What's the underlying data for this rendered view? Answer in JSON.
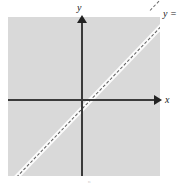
{
  "figure": {
    "name": "cartesian-plane-with-identity-line",
    "background_color": "#ffffff",
    "plane_fill_color": "#d9d9d9",
    "axis_color": "#3a3a3a",
    "line_color": "#5c5c5c",
    "line_highlight_color": "#fbfbfb"
  },
  "axes": {
    "y_label": "y",
    "x_label": "x",
    "y_arrow_direction": "up",
    "x_arrow_direction": "right",
    "origin_label": ""
  },
  "annotations": {
    "line_equation": "y =",
    "caption_mark": "n"
  },
  "chart_data": {
    "type": "line",
    "title": "",
    "xlabel": "x",
    "ylabel": "y",
    "xlim": [
      -5,
      5
    ],
    "ylim": [
      -5,
      5
    ],
    "grid": false,
    "legend": "none",
    "series": [
      {
        "name": "y =",
        "style": "dashed",
        "color": "#5c5c5c",
        "x": [
          -5,
          5
        ],
        "values": [
          -5,
          5
        ]
      }
    ],
    "annotations": [
      {
        "text": "y =",
        "x": 5,
        "y": 5,
        "position": "top-right"
      }
    ]
  }
}
